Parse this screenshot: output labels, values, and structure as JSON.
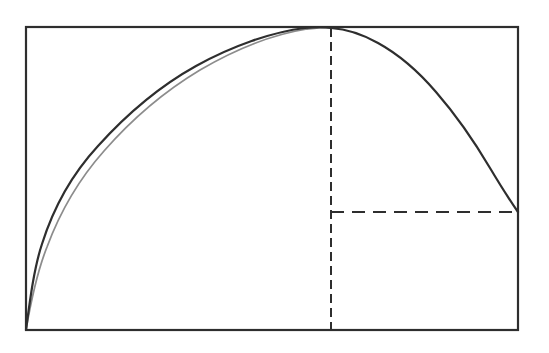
{
  "figure": {
    "background_color": "#ffffff",
    "line_color": "#2e2e2e",
    "canvas": {
      "width": 549,
      "height": 353
    },
    "frame": {
      "label": "bounding-rectangle",
      "left": 26,
      "top": 27,
      "right": 518,
      "bottom": 330,
      "width": 492,
      "height": 303,
      "stroke_width": 2.2
    },
    "curve": {
      "label": "arch-curve",
      "description": "Arch rising from bottom-left corner, tangent to top edge at peak, descending to right edge",
      "stroke_width": 2.2,
      "start_point": {
        "x": 26,
        "y": 330
      },
      "peak_point": {
        "x": 331,
        "y": 28
      },
      "end_point": {
        "x": 518,
        "y": 212
      },
      "path": "M 26 330 C 30 300 34 268 42 244 C 54 206 74 172 98 146 C 126 115 160 86 196 66 C 232 46 272 32 305 28 C 316 27 325 27 331 28 C 346 29 362 34 378 43 C 398 54 418 71 436 92 C 456 115 474 141 490 168 C 502 188 511 202 518 212",
      "shadow_path": "M 26 330 C 31 301 37 272 47 247 C 60 212 80 178 104 151 C 132 119 165 91 200 70 C 236 49 275 34 307 29 C 317 28 326 27 331 28"
    },
    "vertical_dashed_line": {
      "label": "peak-ordinate",
      "x": 331,
      "y_top": 28,
      "y_bottom": 330,
      "dash": "9 5",
      "stroke_width": 2.0
    },
    "horizontal_dashed_line": {
      "label": "endpoint-abscissa",
      "y": 212,
      "x_left": 331,
      "x_right": 518,
      "dash": "13 8",
      "stroke_width": 2.0
    }
  }
}
